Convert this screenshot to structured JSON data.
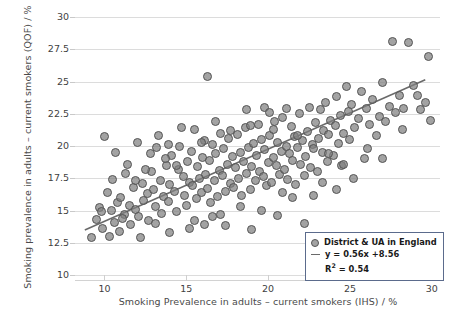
{
  "axes": {
    "y_title": "Smoking prevalence in adults – current smokers (QOF) / %",
    "x_title": "Smoking Prevalence in adults – current smokers (IHS) / %",
    "y_ticks": [
      "10",
      "12.5",
      "15",
      "17.5",
      "20",
      "22.5",
      "25",
      "27.5",
      "30"
    ],
    "x_ticks": [
      "10",
      "15",
      "20",
      "25",
      "30"
    ]
  },
  "legend": {
    "series_label": "District & UA in England",
    "fit_equation": "y = 0.56x +8.56",
    "r_squared_prefix": "R",
    "r_squared_sup": "2",
    "r_squared_value": " = 0.54"
  },
  "chart_data": {
    "type": "scatter",
    "title": "",
    "xlabel": "Smoking Prevalence in adults – current smokers (IHS) / %",
    "ylabel": "Smoking prevalence in adults – current smokers (QOF) / %",
    "xlim": [
      8.2,
      30.5
    ],
    "ylim": [
      10,
      30
    ],
    "xticks": [
      10,
      15,
      20,
      25,
      30
    ],
    "yticks": [
      10,
      12.5,
      15,
      17.5,
      20,
      22.5,
      25,
      27.5,
      30
    ],
    "grid": true,
    "legend_position": "lower-right",
    "series": [
      {
        "name": "District & UA in England",
        "marker": "circle",
        "color": "#808080",
        "edge_color": "#555555",
        "points": [
          [
            9.2,
            12.9
          ],
          [
            9.5,
            14.3
          ],
          [
            9.7,
            15.2
          ],
          [
            9.9,
            13.6
          ],
          [
            10.0,
            20.7
          ],
          [
            10.2,
            16.4
          ],
          [
            10.4,
            15.0
          ],
          [
            10.5,
            17.4
          ],
          [
            10.6,
            14.1
          ],
          [
            10.8,
            15.6
          ],
          [
            10.9,
            13.4
          ],
          [
            11.0,
            16.0
          ],
          [
            11.2,
            14.7
          ],
          [
            11.3,
            17.9
          ],
          [
            11.5,
            15.4
          ],
          [
            11.6,
            13.9
          ],
          [
            11.8,
            16.8
          ],
          [
            11.9,
            15.1
          ],
          [
            12.0,
            20.3
          ],
          [
            12.1,
            14.5
          ],
          [
            12.3,
            17.1
          ],
          [
            12.4,
            15.8
          ],
          [
            12.6,
            16.3
          ],
          [
            12.7,
            14.2
          ],
          [
            12.9,
            18.0
          ],
          [
            13.0,
            16.6
          ],
          [
            13.1,
            15.3
          ],
          [
            13.2,
            19.9
          ],
          [
            13.4,
            17.3
          ],
          [
            13.5,
            14.8
          ],
          [
            13.6,
            16.1
          ],
          [
            13.8,
            18.5
          ],
          [
            13.9,
            15.7
          ],
          [
            14.0,
            17.0
          ],
          [
            14.1,
            19.3
          ],
          [
            14.3,
            16.5
          ],
          [
            14.4,
            14.9
          ],
          [
            14.5,
            18.2
          ],
          [
            14.6,
            20.0
          ],
          [
            14.8,
            17.6
          ],
          [
            14.9,
            16.2
          ],
          [
            15.0,
            15.4
          ],
          [
            15.1,
            18.8
          ],
          [
            15.2,
            17.2
          ],
          [
            15.3,
            19.6
          ],
          [
            15.4,
            16.9
          ],
          [
            15.5,
            21.3
          ],
          [
            15.6,
            15.9
          ],
          [
            15.7,
            18.4
          ],
          [
            15.8,
            17.5
          ],
          [
            15.9,
            16.4
          ],
          [
            16.0,
            19.1
          ],
          [
            16.1,
            20.4
          ],
          [
            16.2,
            17.8
          ],
          [
            16.3,
            16.7
          ],
          [
            16.4,
            18.9
          ],
          [
            16.5,
            15.6
          ],
          [
            16.6,
            20.1
          ],
          [
            16.7,
            17.3
          ],
          [
            16.8,
            19.4
          ],
          [
            16.9,
            16.1
          ],
          [
            17.0,
            18.1
          ],
          [
            17.1,
            21.0
          ],
          [
            17.2,
            17.7
          ],
          [
            17.3,
            19.8
          ],
          [
            17.4,
            16.5
          ],
          [
            17.5,
            18.6
          ],
          [
            17.6,
            20.6
          ],
          [
            17.7,
            17.1
          ],
          [
            17.8,
            19.2
          ],
          [
            17.9,
            16.8
          ],
          [
            18.0,
            18.3
          ],
          [
            18.1,
            20.9
          ],
          [
            18.2,
            17.5
          ],
          [
            18.3,
            19.5
          ],
          [
            18.4,
            16.2
          ],
          [
            18.5,
            18.8
          ],
          [
            18.6,
            21.4
          ],
          [
            18.7,
            17.9
          ],
          [
            18.8,
            19.9
          ],
          [
            18.9,
            16.6
          ],
          [
            19.0,
            18.4
          ],
          [
            19.1,
            20.2
          ],
          [
            19.2,
            17.3
          ],
          [
            19.3,
            19.3
          ],
          [
            19.4,
            21.7
          ],
          [
            19.5,
            18.0
          ],
          [
            19.6,
            20.5
          ],
          [
            19.7,
            17.6
          ],
          [
            19.8,
            19.7
          ],
          [
            19.9,
            16.9
          ],
          [
            20.0,
            18.7
          ],
          [
            20.1,
            20.8
          ],
          [
            20.2,
            17.2
          ],
          [
            20.3,
            19.1
          ],
          [
            20.4,
            21.9
          ],
          [
            20.5,
            18.5
          ],
          [
            20.6,
            20.3
          ],
          [
            20.7,
            17.8
          ],
          [
            20.8,
            19.6
          ],
          [
            20.9,
            22.2
          ],
          [
            21.0,
            18.2
          ],
          [
            21.1,
            20.0
          ],
          [
            21.2,
            17.4
          ],
          [
            21.3,
            19.4
          ],
          [
            21.4,
            21.5
          ],
          [
            21.5,
            18.9
          ],
          [
            21.6,
            20.7
          ],
          [
            21.7,
            17.0
          ],
          [
            21.8,
            19.9
          ],
          [
            21.9,
            22.5
          ],
          [
            22.0,
            18.6
          ],
          [
            22.1,
            20.4
          ],
          [
            22.2,
            17.7
          ],
          [
            22.3,
            19.2
          ],
          [
            22.4,
            21.1
          ],
          [
            22.5,
            23.0
          ],
          [
            22.6,
            18.3
          ],
          [
            22.7,
            20.1
          ],
          [
            22.8,
            19.8
          ],
          [
            22.9,
            21.8
          ],
          [
            23.0,
            18.0
          ],
          [
            23.1,
            20.6
          ],
          [
            23.2,
            22.8
          ],
          [
            23.3,
            19.5
          ],
          [
            23.4,
            21.2
          ],
          [
            23.5,
            23.4
          ],
          [
            23.6,
            18.8
          ],
          [
            23.7,
            20.9
          ],
          [
            23.8,
            22.0
          ],
          [
            24.0,
            19.3
          ],
          [
            24.1,
            21.6
          ],
          [
            24.2,
            23.8
          ],
          [
            24.3,
            20.2
          ],
          [
            24.4,
            22.4
          ],
          [
            24.5,
            18.5
          ],
          [
            24.6,
            21.0
          ],
          [
            24.8,
            24.6
          ],
          [
            24.9,
            22.7
          ],
          [
            25.0,
            20.5
          ],
          [
            25.1,
            23.2
          ],
          [
            25.3,
            21.4
          ],
          [
            25.5,
            22.1
          ],
          [
            25.7,
            24.2
          ],
          [
            25.9,
            19.0
          ],
          [
            26.0,
            22.9
          ],
          [
            26.2,
            21.7
          ],
          [
            26.4,
            23.6
          ],
          [
            26.6,
            20.8
          ],
          [
            26.8,
            22.3
          ],
          [
            27.0,
            24.9
          ],
          [
            27.2,
            21.9
          ],
          [
            27.4,
            23.1
          ],
          [
            27.6,
            28.1
          ],
          [
            27.8,
            22.6
          ],
          [
            28.0,
            23.9
          ],
          [
            28.2,
            21.3
          ],
          [
            28.6,
            28.0
          ],
          [
            28.9,
            24.7
          ],
          [
            29.3,
            22.8
          ],
          [
            29.6,
            23.4
          ],
          [
            29.8,
            26.9
          ],
          [
            29.9,
            22.0
          ],
          [
            16.3,
            25.4
          ],
          [
            24.6,
            18.6
          ],
          [
            27.0,
            19.0
          ],
          [
            22.2,
            14.0
          ],
          [
            14.0,
            13.3
          ],
          [
            15.2,
            13.6
          ],
          [
            17.4,
            13.8
          ],
          [
            19.0,
            13.5
          ],
          [
            20.6,
            14.6
          ],
          [
            12.2,
            12.9
          ],
          [
            10.7,
            19.5
          ],
          [
            11.4,
            18.6
          ],
          [
            13.3,
            20.8
          ],
          [
            18.7,
            22.8
          ],
          [
            19.8,
            23.0
          ],
          [
            21.1,
            22.9
          ],
          [
            16.8,
            21.9
          ],
          [
            14.7,
            21.4
          ],
          [
            13.9,
            20.1
          ],
          [
            12.8,
            19.4
          ],
          [
            20.1,
            22.6
          ],
          [
            23.3,
            17.2
          ],
          [
            25.2,
            17.5
          ],
          [
            21.5,
            16.0
          ],
          [
            18.3,
            15.3
          ],
          [
            16.6,
            14.5
          ],
          [
            15.5,
            14.2
          ],
          [
            17.1,
            14.7
          ],
          [
            19.6,
            15.0
          ],
          [
            22.8,
            16.2
          ],
          [
            24.2,
            16.6
          ],
          [
            11.9,
            17.3
          ],
          [
            10.3,
            13.0
          ],
          [
            9.8,
            14.9
          ],
          [
            12.5,
            18.2
          ],
          [
            13.7,
            19.0
          ],
          [
            14.4,
            18.5
          ],
          [
            15.9,
            20.3
          ],
          [
            17.7,
            21.2
          ],
          [
            18.9,
            21.6
          ],
          [
            20.3,
            21.3
          ],
          [
            21.8,
            20.8
          ],
          [
            23.7,
            19.4
          ],
          [
            26.1,
            19.8
          ],
          [
            28.3,
            22.9
          ],
          [
            29.1,
            23.9
          ],
          [
            16.1,
            13.9
          ],
          [
            20.9,
            16.4
          ],
          [
            13.1,
            14.0
          ],
          [
            11.1,
            14.4
          ]
        ]
      }
    ],
    "fit_line": {
      "label": "y = 0.56x +8.56",
      "slope": 0.56,
      "intercept": 8.56,
      "r_squared": 0.54,
      "x_start": 8.8,
      "x_end": 29.6,
      "color": "#6a6a6a"
    }
  }
}
